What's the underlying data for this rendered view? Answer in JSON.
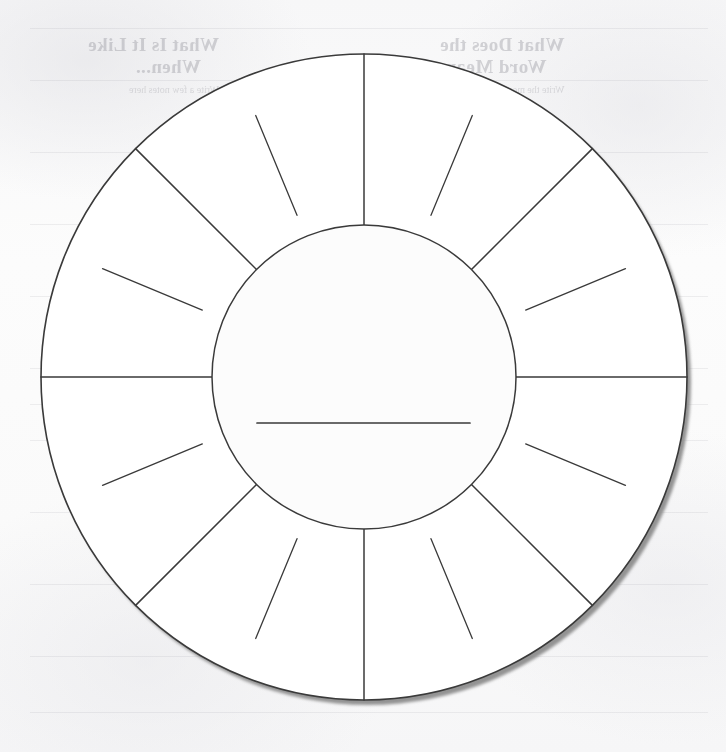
{
  "page": {
    "paper_color": "#fbfbfb",
    "ink_color": "#3a3a3a",
    "shadow_color": "#8d8d8d"
  },
  "wheel": {
    "name": "blank-segmented-wheel",
    "center_x": 364,
    "center_y": 377,
    "outer_radius": 323,
    "inner_radius": 152,
    "full_spoke_count": 8,
    "full_spoke_step_degrees": 45,
    "short_line_count": 16,
    "short_line_offset_degrees": 22.5,
    "short_line_inner_radius": 175,
    "short_line_outer_radius": 283,
    "segment_count": 8,
    "write_line": {
      "label": "center-write-in-line",
      "x1": 257,
      "x2": 470,
      "y": 423
    }
  },
  "bleed_through": {
    "note": "mirrored text showing through from the reverse side of the page",
    "blocks": [
      {
        "heading_line1": "What Is It Like",
        "heading_line2": "When...",
        "sub": "Write a few notes here",
        "left": 88,
        "top": 34,
        "size": "head"
      },
      {
        "heading_line1": "What Does the",
        "heading_line2": "Word Mean",
        "sub": "Write the meaning",
        "left": 440,
        "top": 34,
        "size": "head"
      },
      {
        "heading_line1": "How Can You Use",
        "heading_line2": "It?",
        "sub": "Write some ideas that you can use",
        "left": 86,
        "top": 418,
        "size": "head"
      },
      {
        "heading_line1": "What Is It",
        "heading_line2": "When Not",
        "sub": "",
        "left": 450,
        "top": 418,
        "size": "head"
      }
    ],
    "rule_rows": [
      28,
      80,
      152,
      224,
      296,
      368,
      404,
      440,
      512,
      584,
      656,
      712
    ]
  }
}
